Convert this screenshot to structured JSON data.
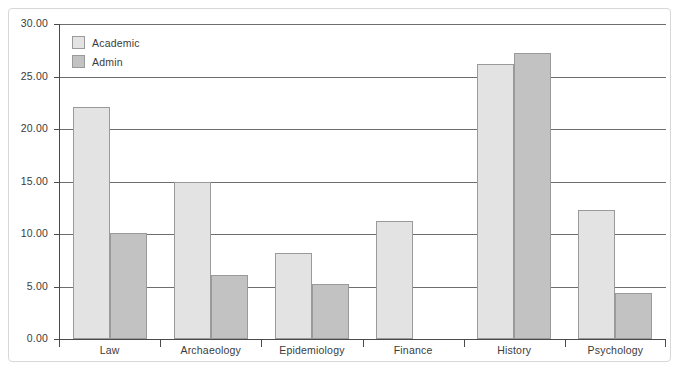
{
  "chart_data": {
    "type": "bar",
    "title": "",
    "subtitle": "",
    "xlabel": "",
    "ylabel": "",
    "categories": [
      "Law",
      "Archaeology",
      "Epidemiology",
      "Finance",
      "History",
      "Psychology"
    ],
    "series": [
      {
        "name": "Academic",
        "color": "#e3e3e3",
        "values": [
          22.1,
          15.0,
          8.2,
          11.2,
          26.2,
          12.3
        ]
      },
      {
        "name": "Admin",
        "color": "#c2c2c2",
        "values": [
          10.1,
          6.1,
          5.2,
          0,
          27.2,
          4.4
        ]
      }
    ],
    "ylim": [
      0,
      30
    ],
    "ytick_values": [
      30,
      25,
      20,
      15,
      10,
      5,
      0
    ],
    "ytick_labels": [
      "30.00",
      "25.00",
      "20.00",
      "15.00",
      "10.00",
      "5.00",
      "0.00"
    ],
    "grid": true,
    "grid_axis": "y",
    "legend_position": "top-left",
    "bar_mode": "grouped",
    "annotations": []
  },
  "legend": {
    "items": [
      {
        "label": "Academic",
        "swatch": "academic-swatch"
      },
      {
        "label": "Admin",
        "swatch": "admin-swatch"
      }
    ]
  },
  "frame": {
    "border_color": "#d8d8d8",
    "background": "#ffffff"
  }
}
